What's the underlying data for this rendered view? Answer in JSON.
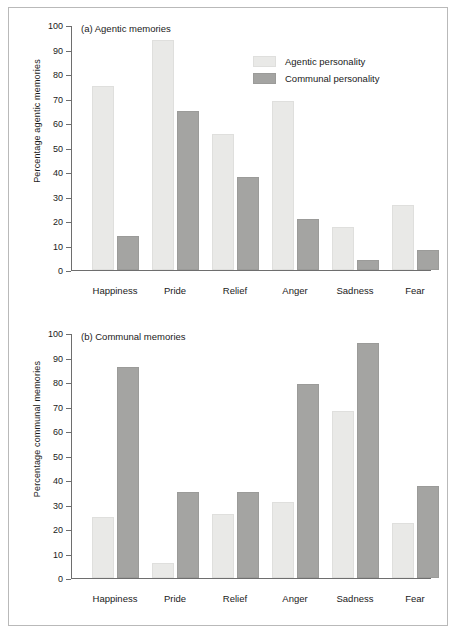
{
  "figure": {
    "legend": {
      "entries": [
        {
          "label": "Agentic personality",
          "color": "#e9e9e7",
          "key": "agentic"
        },
        {
          "label": "Communal personality",
          "color": "#a4a4a2",
          "key": "communal"
        }
      ]
    }
  },
  "chart_data": [
    {
      "type": "bar",
      "title": "(a) Agentic memories",
      "panel": "a",
      "xlabel": "",
      "ylabel": "Percentage agentic memories",
      "ylim": [
        0,
        100
      ],
      "ytick_step": 10,
      "yticks": [
        0,
        10,
        20,
        30,
        40,
        50,
        60,
        70,
        80,
        90,
        100
      ],
      "grid": false,
      "legend_position": "top-right",
      "categories": [
        "Happiness",
        "Pride",
        "Relief",
        "Anger",
        "Sadness",
        "Fear"
      ],
      "series": [
        {
          "name": "Agentic personality",
          "color": "#e9e9e7",
          "values": [
            75,
            94,
            55.5,
            69,
            17.5,
            26.5
          ]
        },
        {
          "name": "Communal personality",
          "color": "#a4a4a2",
          "values": [
            14,
            65,
            38,
            21,
            4,
            8
          ]
        }
      ]
    },
    {
      "type": "bar",
      "title": "(b) Communal memories",
      "panel": "b",
      "xlabel": "",
      "ylabel": "Percentage communal memories",
      "ylim": [
        0,
        100
      ],
      "ytick_step": 10,
      "yticks": [
        0,
        10,
        20,
        30,
        40,
        50,
        60,
        70,
        80,
        90,
        100
      ],
      "grid": false,
      "legend_position": "none",
      "categories": [
        "Happiness",
        "Pride",
        "Relief",
        "Anger",
        "Sadness",
        "Fear"
      ],
      "series": [
        {
          "name": "Agentic personality",
          "color": "#e9e9e7",
          "values": [
            25,
            6,
            26,
            31,
            68,
            22.5
          ]
        },
        {
          "name": "Communal personality",
          "color": "#a4a4a2",
          "values": [
            86,
            35,
            35,
            79,
            96,
            37.5
          ]
        }
      ]
    }
  ]
}
